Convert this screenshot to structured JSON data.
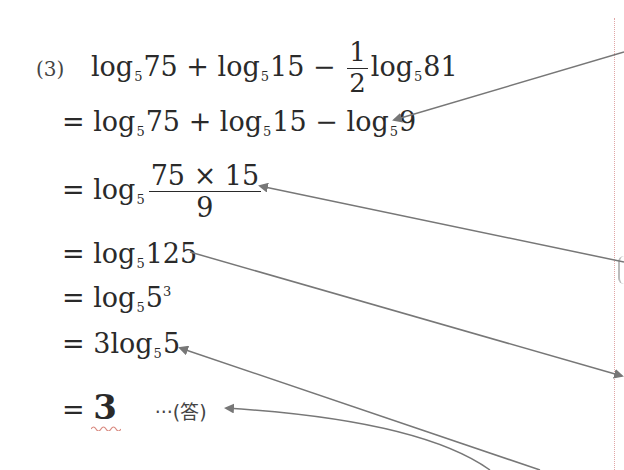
{
  "problem": {
    "label": "(3)",
    "expression": {
      "t1": "log",
      "b1": "5",
      "a1": "75",
      "op1": "+",
      "t2": "log",
      "b2": "5",
      "a2": "15",
      "op2": "−",
      "frac_num": "1",
      "frac_den": "2",
      "t3": "log",
      "b3": "5",
      "a3": "81"
    }
  },
  "steps": [
    {
      "eq": "=",
      "t1": "log",
      "b1": "5",
      "a1": "75",
      "op1": "+",
      "t2": "log",
      "b2": "5",
      "a2": "15",
      "op2": "−",
      "t3": "log",
      "b3": "5",
      "a3": "9"
    },
    {
      "eq": "=",
      "t1": "log",
      "b1": "5",
      "num": "75 × 15",
      "den": "9"
    },
    {
      "eq": "=",
      "t1": "log",
      "b1": "5",
      "a1": "125"
    },
    {
      "eq": "=",
      "t1": "log",
      "b1": "5",
      "a1": "5",
      "exp": "3"
    },
    {
      "eq": "=",
      "coef": "3",
      "t1": "log",
      "b1": "5",
      "a1": "5"
    },
    {
      "eq": "=",
      "answer": "3",
      "note": "···(答)"
    }
  ],
  "colors": {
    "text": "#2a2a2a",
    "arrow": "#777777",
    "margin_line": "#e0a6a6",
    "squiggle": "#d98a80"
  }
}
